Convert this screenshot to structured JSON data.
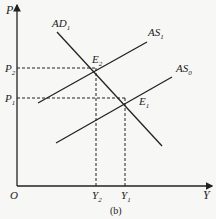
{
  "figure": {
    "caption": "(b)",
    "axes": {
      "y_label": "P",
      "x_label": "Y",
      "origin_label": "O"
    },
    "price_levels": [
      {
        "name": "P",
        "sub": "2"
      },
      {
        "name": "P",
        "sub": "1"
      }
    ],
    "output_levels": [
      {
        "name": "Y",
        "sub": "2"
      },
      {
        "name": "Y",
        "sub": "1"
      }
    ],
    "curves": [
      {
        "name": "AD",
        "sub": "1"
      },
      {
        "name": "AS",
        "sub": "1"
      },
      {
        "name": "AS",
        "sub": "0"
      }
    ],
    "equilibria": [
      {
        "name": "E",
        "sub": "2"
      },
      {
        "name": "E",
        "sub": "1"
      }
    ],
    "colors": {
      "line": "#222222",
      "background": "#f7f7f5"
    }
  }
}
